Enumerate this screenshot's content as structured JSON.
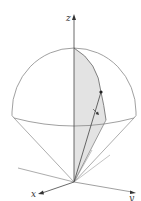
{
  "figure": {
    "type": "3D hemisphere over cone with spherical coordinate wedge",
    "axes": {
      "x_label": "x",
      "y_label": "y",
      "z_label": "z"
    },
    "colors": {
      "line": "#7a7a7a",
      "axis": "#4a4a4a",
      "shade": "#e0e0e0",
      "point": "#222222"
    }
  }
}
